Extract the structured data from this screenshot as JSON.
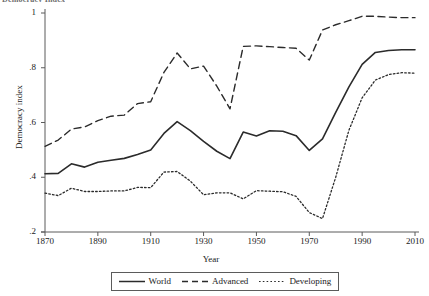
{
  "top_caption": "Democracy Index",
  "axes": {
    "ylabel": "Democracy index",
    "xlabel": "Year",
    "yticks": [
      "1",
      ".8",
      ".6",
      ".4",
      ".2"
    ],
    "xticks": [
      "1870",
      "1890",
      "1910",
      "1930",
      "1950",
      "1970",
      "1990",
      "2010"
    ]
  },
  "legend": {
    "world": "World",
    "advanced": "Advanced",
    "developing": "Developing"
  },
  "colors": {
    "line": "#2b2b2b",
    "axis": "#5b5b5b",
    "background": "#ffffff"
  },
  "chart_data": {
    "type": "line",
    "title": "Democracy Index",
    "xlabel": "Year",
    "ylabel": "Democracy index",
    "xlim": [
      1870,
      2010
    ],
    "ylim": [
      0.2,
      1.0
    ],
    "xticks": [
      1870,
      1890,
      1910,
      1930,
      1950,
      1970,
      1990,
      2010
    ],
    "yticks": [
      0.2,
      0.4,
      0.6,
      0.8,
      1.0
    ],
    "grid": false,
    "legend_position": "bottom",
    "x": [
      1870,
      1875,
      1880,
      1885,
      1890,
      1895,
      1900,
      1905,
      1910,
      1915,
      1920,
      1925,
      1930,
      1935,
      1940,
      1945,
      1950,
      1955,
      1960,
      1965,
      1970,
      1975,
      1980,
      1985,
      1990,
      1995,
      2000,
      2005,
      2010
    ],
    "series": [
      {
        "name": "World",
        "style": "solid",
        "values": [
          0.413,
          0.414,
          0.449,
          0.437,
          0.455,
          0.462,
          0.469,
          0.483,
          0.5,
          0.56,
          0.603,
          0.57,
          0.531,
          0.495,
          0.468,
          0.565,
          0.551,
          0.57,
          0.568,
          0.552,
          0.498,
          0.54,
          0.637,
          0.73,
          0.812,
          0.856,
          0.863,
          0.866,
          0.866
        ]
      },
      {
        "name": "Advanced",
        "style": "dashed",
        "values": [
          0.513,
          0.536,
          0.576,
          0.584,
          0.607,
          0.623,
          0.627,
          0.669,
          0.676,
          0.783,
          0.854,
          0.796,
          0.806,
          0.733,
          0.65,
          0.878,
          0.88,
          0.877,
          0.874,
          0.871,
          0.828,
          0.938,
          0.957,
          0.972,
          0.988,
          0.988,
          0.985,
          0.983,
          0.983
        ]
      },
      {
        "name": "Developing",
        "style": "dotted",
        "values": [
          0.342,
          0.333,
          0.36,
          0.348,
          0.348,
          0.35,
          0.35,
          0.363,
          0.362,
          0.419,
          0.421,
          0.386,
          0.336,
          0.343,
          0.343,
          0.321,
          0.351,
          0.349,
          0.347,
          0.33,
          0.271,
          0.249,
          0.4,
          0.572,
          0.69,
          0.755,
          0.775,
          0.782,
          0.78
        ]
      }
    ]
  }
}
